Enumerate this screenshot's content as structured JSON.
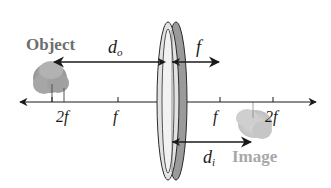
{
  "diagram": {
    "type": "converging-lens-ray-geometry",
    "labels": {
      "object": "Object",
      "image": "Image",
      "object_distance": {
        "base": "d",
        "sub": "o"
      },
      "image_distance": {
        "base": "d",
        "sub": "i"
      },
      "focal_length": "f"
    },
    "axis_ticks": {
      "left_2f": "2f",
      "left_f": "f",
      "right_f": "f",
      "right_2f": "2f"
    },
    "colors": {
      "line": "#1a1a1a",
      "object_label": "#6e6e6e",
      "image_label": "#a8a8a8",
      "lens_fill_light": "#e4e4e4",
      "lens_fill_dark": "#9a9a9a",
      "tree_object": "#9c9c9c",
      "tree_image": "#c4c4c4"
    }
  }
}
